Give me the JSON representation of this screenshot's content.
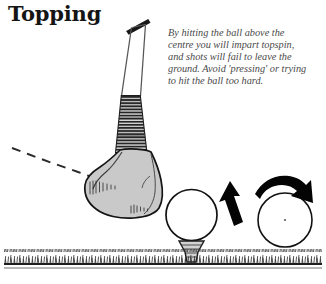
{
  "page": {
    "title": "Topping",
    "background_color": "#ffffff",
    "ink_color": "#151515"
  },
  "caption": {
    "lines": [
      "By hitting the ball above the",
      "centre you will impart topspin,",
      "and shots will fail to leave the",
      "ground. Avoid 'pressing' or trying",
      "to hit the ball too hard."
    ],
    "full_text": "By hitting the ball above the centre you will impart topspin, and shots will fail to leave the ground. Avoid 'pressing' or trying to hit the ball too hard.",
    "text_color": "#4a4a4a"
  },
  "illustration": {
    "club": {
      "name": "golf-club-driver",
      "grip_color": "#1a1a1a",
      "shaft_color": "#3a3a3a",
      "hosel_hatch_color": "#2b2b2b",
      "head_fill": "#c9c9c9",
      "head_outline": "#1a1a1a"
    },
    "swing_path": {
      "name": "dashed-swing-path",
      "style": "dashed",
      "color": "#2a2a2a"
    },
    "teed_ball": {
      "name": "golf-ball-on-tee",
      "fill": "#ffffff",
      "outline": "#111111"
    },
    "tee": {
      "name": "golf-tee",
      "color": "#2a2a2a"
    },
    "spin_ball": {
      "name": "golf-ball-topspin",
      "fill": "#ffffff",
      "outline": "#111111",
      "center_mark": true
    },
    "arrows": {
      "curved_arrow_label": "topspin-rotation-arrow",
      "straight_arrow_label": "ball-direction-arrow",
      "color": "#000000"
    },
    "ground": {
      "name": "ground-line-with-grass",
      "line_color": "#222222",
      "grass_color": "#333333"
    }
  }
}
